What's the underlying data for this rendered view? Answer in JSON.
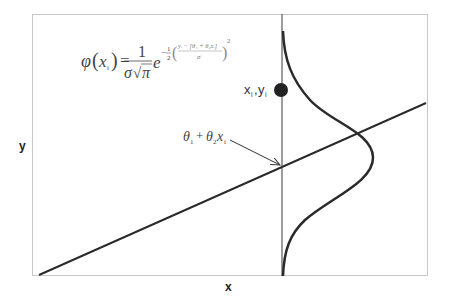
{
  "diagram": {
    "type": "linear-regression-normal-error",
    "axis_labels": {
      "x": "x",
      "y": "y"
    },
    "point_label": {
      "x": "x",
      "x_sub": "i",
      "sep": ",",
      "y": "y",
      "y_sub": "i"
    },
    "regression_label": {
      "theta1": "θ",
      "theta1_sub": "1",
      "plus": "+",
      "theta2": "θ",
      "theta2_sub": "2",
      "x": "x",
      "x_sub": "i"
    },
    "formula": {
      "lhs_phi": "φ",
      "lhs_open": "(",
      "lhs_x": "x",
      "lhs_x_sub": "i",
      "lhs_close": ")",
      "equals": "=",
      "numerator": "1",
      "denominator_sigma": "σ",
      "denominator_root": "√",
      "denominator_pi": "π",
      "base": "e",
      "exp_minus": "−",
      "exp_half_num": "1",
      "exp_half_den": "2",
      "exp_inner_num": "yᵢ − [θ₁ + θ₂xᵢ]",
      "exp_inner_den": "σ",
      "exp_power": "2"
    },
    "colors": {
      "frame": "#c8c8c8",
      "stroke": "#2a2a2a",
      "thin": "#3a3a3a",
      "text": "#333333",
      "point": "#222222"
    }
  }
}
